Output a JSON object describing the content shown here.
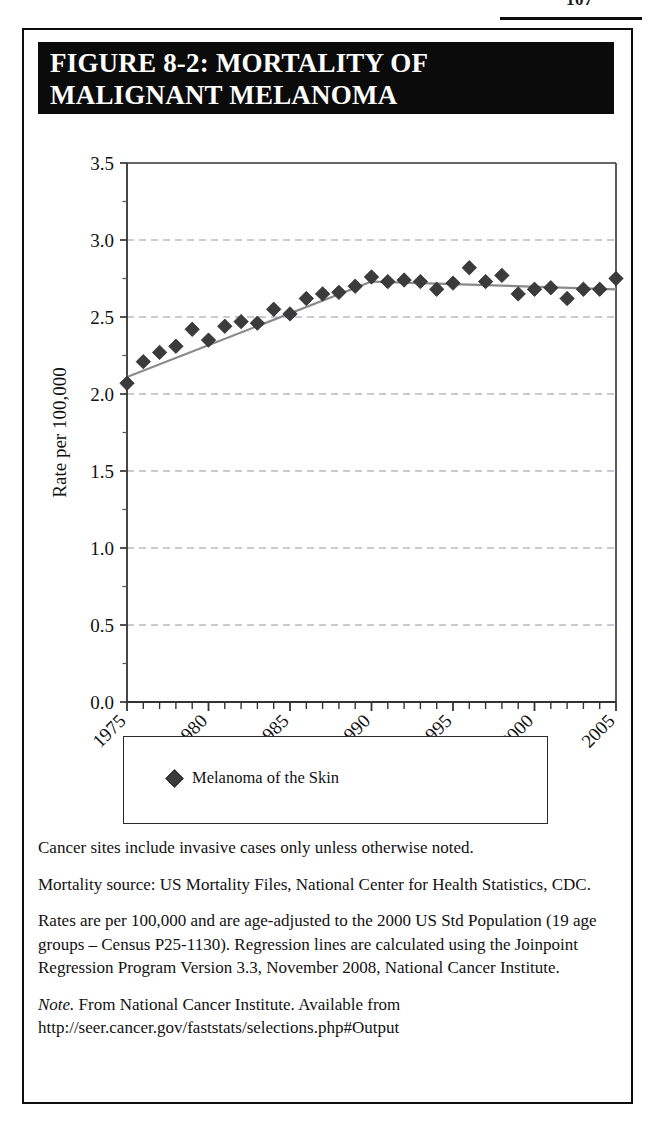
{
  "page": {
    "folio": "107"
  },
  "figure": {
    "title_line1": "FIGURE 8-2: MORTALITY OF",
    "title_line2": "MALIGNANT MELANOMA"
  },
  "legend": {
    "marker_icon": "diamond-marker-icon",
    "label": "Melanoma of the Skin"
  },
  "notes": {
    "note1": "Cancer sites include invasive cases only unless otherwise noted.",
    "note2": "Mortality source: US Mortality Files, National Center for Health Statistics, CDC.",
    "note3": "Rates are per 100,000 and are age-adjusted to the 2000 US Std Population (19 age groups – Census P25-1130). Regression lines are calculated using the Joinpoint Regression Program Version 3.3, November 2008, National Cancer Institute.",
    "note4_em": "Note.",
    "note4": " From National Cancer Institute. Available from http://seer.cancer.gov/faststats/selections.php#Output"
  },
  "colors": {
    "marker": "#3b3b3b",
    "trend_line": "#8a8a8a",
    "gridline": "#b9b9c4",
    "axis": "#4a4a4a",
    "title_bar": "#0b0b0b",
    "border": "#0d0d0d"
  },
  "chart_data": {
    "type": "scatter",
    "title": "FIGURE 8-2: MORTALITY OF MALIGNANT MELANOMA",
    "xlabel": "Year of Death",
    "ylabel": "Rate per 100,000",
    "xlim": [
      1975,
      2005
    ],
    "ylim": [
      0.0,
      3.5
    ],
    "yticks": [
      0.0,
      0.5,
      1.0,
      1.5,
      2.0,
      2.5,
      3.0,
      3.5
    ],
    "ytick_labels": [
      "0.0",
      "0.5",
      "1.0",
      "1.5",
      "2.0",
      "2.5",
      "3.0",
      "3.5"
    ],
    "xticks": [
      1975,
      1980,
      1985,
      1990,
      1995,
      2000,
      2005
    ],
    "xtick_labels": [
      "1975",
      "1980",
      "1985",
      "1990",
      "1995",
      "2000",
      "2005"
    ],
    "xtick_minor_step": 1,
    "xtick_label_rotation": -45,
    "grid": "horizontal-dashed",
    "legend_position": "below-plot",
    "series": [
      {
        "name": "Melanoma of the Skin",
        "marker": "diamond",
        "x": [
          1975,
          1976,
          1977,
          1978,
          1979,
          1980,
          1981,
          1982,
          1983,
          1984,
          1985,
          1986,
          1987,
          1988,
          1989,
          1990,
          1991,
          1992,
          1993,
          1994,
          1995,
          1996,
          1997,
          1998,
          1999,
          2000,
          2001,
          2002,
          2003,
          2004,
          2005
        ],
        "y": [
          2.07,
          2.21,
          2.27,
          2.31,
          2.42,
          2.35,
          2.44,
          2.47,
          2.46,
          2.55,
          2.52,
          2.62,
          2.65,
          2.66,
          2.7,
          2.76,
          2.73,
          2.74,
          2.73,
          2.68,
          2.72,
          2.82,
          2.73,
          2.77,
          2.65,
          2.68,
          2.69,
          2.62,
          2.68,
          2.68,
          2.75
        ]
      }
    ],
    "trend_segments": [
      {
        "name": "joinpoint-segment-1",
        "x": [
          1975,
          1990
        ],
        "y": [
          2.11,
          2.73
        ]
      },
      {
        "name": "joinpoint-segment-2",
        "x": [
          1990,
          2005
        ],
        "y": [
          2.73,
          2.68
        ]
      }
    ]
  }
}
